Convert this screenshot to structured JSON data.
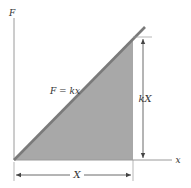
{
  "diagram": {
    "type": "force-displacement graph",
    "axes": {
      "y_label": "F",
      "x_label": "x"
    },
    "line_label": "F = kx",
    "height_label": "kX",
    "width_label": "X",
    "colors": {
      "background": "#ffffff",
      "axis": "#9a9a9a",
      "line": "#7a7a7a",
      "fill": "#a8a8a8",
      "dimension": "#444444",
      "text": "#333333"
    }
  }
}
